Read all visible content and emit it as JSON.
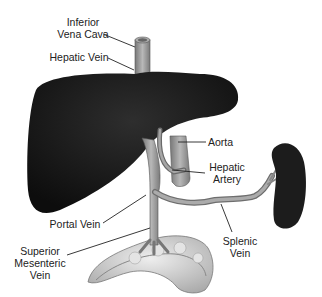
{
  "labels": {
    "ivc": {
      "line1": "Inferior",
      "line2": "Vena Cava"
    },
    "hepatic_vein": "Hepatic Vein",
    "aorta": "Aorta",
    "hepatic_artery": {
      "line1": "Hepatic",
      "line2": "Artery"
    },
    "portal_vein": "Portal Vein",
    "smv": {
      "line1": "Superior",
      "line2": "Mesenteric",
      "line3": "Vein"
    },
    "splenic_vein": {
      "line1": "Splenic",
      "line2": "Vein"
    }
  },
  "colors": {
    "liver": "#1a1a1a",
    "vessel": "#9a9a9a",
    "vessel_dark": "#6e6e6e",
    "spleen": "#1c1c1c",
    "intestine": "#cfcfcf",
    "leader_line": "#222222"
  }
}
